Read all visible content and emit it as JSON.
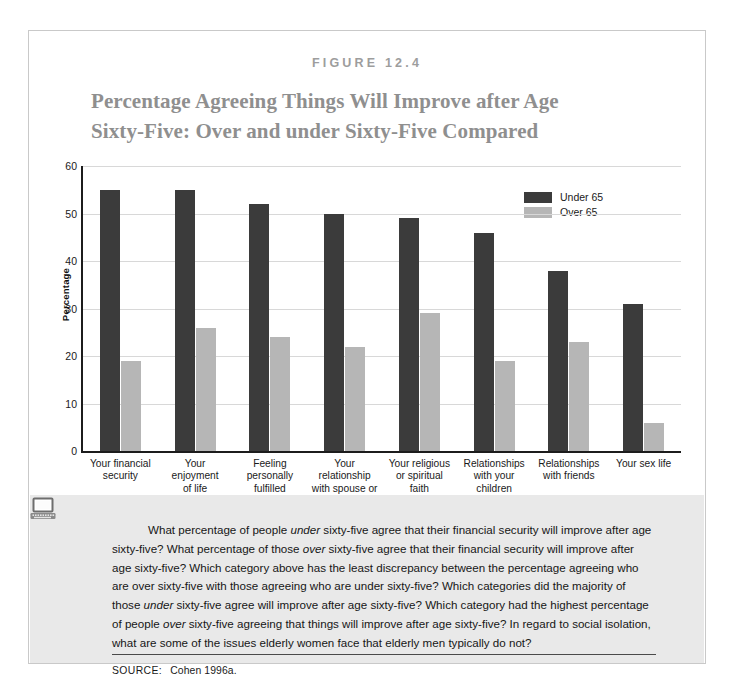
{
  "figure": {
    "number_label": "FIGURE 12.4",
    "title_line1": "Percentage Agreeing Things Will Improve after Age",
    "title_line2": "Sixty-Five: Over and under Sixty-Five Compared",
    "source_label": "SOURCE:",
    "source_value": "Cohen 1996a."
  },
  "colors": {
    "under65": "#3b3b3b",
    "over65": "#b6b6b6",
    "title": "#8f8f8f",
    "figure_number": "#9d9d9d",
    "caption_bg": "#e9e9e9",
    "axis": "#1c1c1c",
    "grid": "#d8d8d8"
  },
  "icons": {
    "laptop": "laptop-icon"
  },
  "caption": {
    "segments": [
      {
        "text": "What percentage of people ",
        "italic": false
      },
      {
        "text": "under",
        "italic": true
      },
      {
        "text": " sixty-five agree that their financial security will improve after age sixty-five? What percentage of those ",
        "italic": false
      },
      {
        "text": "over",
        "italic": true
      },
      {
        "text": " sixty-five agree that their financial security will improve after age sixty-five? Which category above has the least discrepancy between the percentage agreeing who are over sixty-five with those agreeing who are under sixty-five? Which categories did the majority of those ",
        "italic": false
      },
      {
        "text": "under",
        "italic": true
      },
      {
        "text": " sixty-five agree will improve after age sixty-five? Which category had the highest percentage of people ",
        "italic": false
      },
      {
        "text": "over",
        "italic": true
      },
      {
        "text": " sixty-five agreeing that things will improve after age sixty-five? In regard to social isolation, ",
        "italic": false
      },
      {
        "text": "what are some of the issues elderly women face that elderly men typically do not?",
        "italic": false
      }
    ]
  },
  "chart_data": {
    "type": "bar",
    "title": "Percentage Agreeing Things Will Improve after Age Sixty-Five: Over and under Sixty-Five Compared",
    "xlabel": "",
    "ylabel": "Percentage",
    "ylim": [
      0,
      60
    ],
    "yticks": [
      0,
      10,
      20,
      30,
      40,
      50,
      60
    ],
    "grid": true,
    "legend_position": "top-right",
    "categories": [
      "Your financial security",
      "Your enjoyment of life",
      "Feeling personally fulfilled",
      "Your relationship with spouse or",
      "Your religious or spiritual faith",
      "Relationships with your children",
      "Relationships with friends",
      "Your sex life"
    ],
    "category_lines": [
      [
        "Your financial",
        "security"
      ],
      [
        "Your",
        "enjoyment",
        "of life"
      ],
      [
        "Feeling",
        "personally",
        "fulfilled"
      ],
      [
        "Your",
        "relationship",
        "with spouse or"
      ],
      [
        "Your religious",
        "or spiritual",
        "faith"
      ],
      [
        "Relationships",
        "with your",
        "children"
      ],
      [
        "Relationships",
        "with friends"
      ],
      [
        "Your sex life"
      ]
    ],
    "series": [
      {
        "name": "Under 65",
        "color": "#3b3b3b",
        "values": [
          55,
          55,
          52,
          50,
          49,
          46,
          38,
          31
        ]
      },
      {
        "name": "Over 65",
        "color": "#b6b6b6",
        "values": [
          19,
          26,
          24,
          22,
          29,
          19,
          23,
          6
        ]
      }
    ]
  }
}
